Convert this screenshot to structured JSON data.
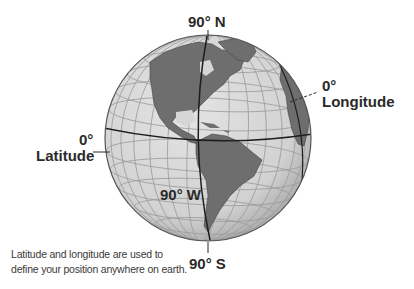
{
  "diagram": {
    "type": "globe",
    "labels": {
      "north_pole": "90° N",
      "south_pole": "90° S",
      "longitude_zero_value": "0°",
      "longitude_zero_name": "Longitude",
      "latitude_zero_value": "0°",
      "latitude_zero_name": "Latitude",
      "meridian_90w": "90° W"
    },
    "caption": {
      "line1": "Latitude and longitude are used to",
      "line2": "define your position anywhere on earth."
    },
    "colors": {
      "ocean": "#d6d6d6",
      "land": "#6e6e6e",
      "grid": "#9a9a9a",
      "outline": "#555555",
      "highlight_lines": "#1e1e1e",
      "text": "#2a2a2a"
    }
  }
}
